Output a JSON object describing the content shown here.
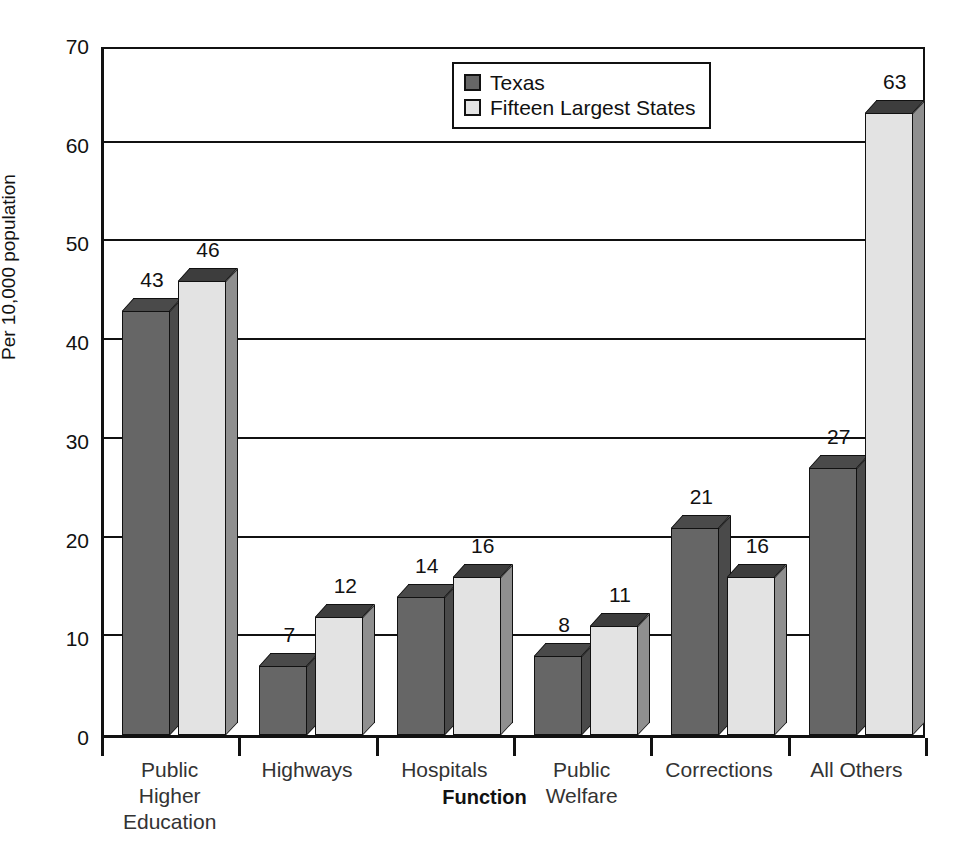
{
  "chart_data": {
    "type": "bar",
    "title": "",
    "xlabel": "Function",
    "ylabel": "Per 10,000 population",
    "ylim": [
      0,
      70
    ],
    "ytick_step": 10,
    "yticks": [
      0,
      10,
      20,
      30,
      40,
      50,
      60,
      70
    ],
    "grid": true,
    "legend_position": "top-center",
    "categories": [
      "Public\nHigher Education",
      "Highways",
      "Hospitals",
      "Public\nWelfare",
      "Corrections",
      "All Others"
    ],
    "series": [
      {
        "name": "Texas",
        "color": "#666666",
        "values": [
          43,
          7,
          14,
          8,
          21,
          27
        ]
      },
      {
        "name": "Fifteen Largest States",
        "color": "#e3e3e3",
        "values": [
          46,
          12,
          16,
          11,
          16,
          63
        ]
      }
    ]
  },
  "legend": {
    "items": [
      {
        "label": "Texas",
        "color": "#666666"
      },
      {
        "label": "Fifteen Largest States",
        "color": "#e3e3e3"
      }
    ]
  },
  "axes": {
    "y_title": "Per 10,000 population",
    "x_title": "Function",
    "y_labels": [
      "70",
      "60",
      "50",
      "40",
      "30",
      "20",
      "10",
      "0"
    ]
  }
}
